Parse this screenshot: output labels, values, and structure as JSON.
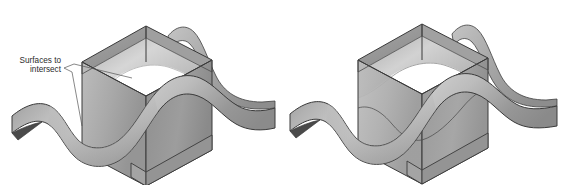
{
  "figure": {
    "domain": "diagram",
    "background_color": "#ffffff",
    "width": 563,
    "height": 185,
    "panels": [
      {
        "id": "left-panel",
        "name": "annotated-surfaces-panel",
        "has_annotation": true,
        "objects": [
          "wave-surface",
          "open-box"
        ]
      },
      {
        "id": "right-panel",
        "name": "intersection-result-panel",
        "has_annotation": false,
        "objects": [
          "wave-surface",
          "open-box",
          "intersection-curve"
        ]
      }
    ]
  },
  "annotation": {
    "label_line_1": "Surfaces to",
    "label_line_2": "intersect",
    "leader_count": 2,
    "text_color": "#2b2b2b",
    "leader_color": "#555555"
  },
  "colors": {
    "background": "#ffffff",
    "outline": "#3a3a3a",
    "box_face_left_light": "#b4b4b4",
    "box_face_left_dark": "#8c8c8c",
    "box_face_right_light": "#a0a0a0",
    "box_face_right_dark": "#7d7d7d",
    "box_inner_wall": "#9a9a9a",
    "box_rim": "#707070",
    "surface_top_light": "#cfcfcf",
    "surface_top_mid": "#a9a9a9",
    "surface_top_dark": "#8a8a8a",
    "surface_underside": "#4a4a4a",
    "surface_shadow": "#7a7a7a",
    "transparent_overlay": "rgba(150,150,150,0.45)"
  }
}
